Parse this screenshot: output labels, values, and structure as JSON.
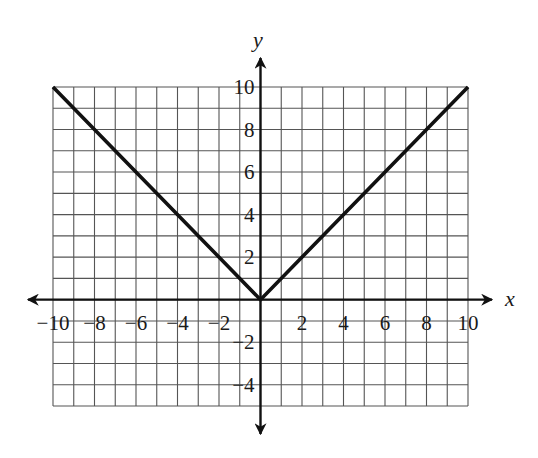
{
  "chart_data": {
    "type": "line",
    "title": "",
    "function": "y = |x|",
    "xlabel": "x",
    "ylabel": "y",
    "xlim": [
      -10,
      10
    ],
    "ylim": [
      -5,
      10
    ],
    "grid": true,
    "grid_step": 1,
    "x_ticks": [
      -10,
      -8,
      -6,
      -4,
      -2,
      2,
      4,
      6,
      8,
      10
    ],
    "x_tick_labels": [
      "−10",
      "−8",
      "−6",
      "−4",
      "−2",
      "2",
      "4",
      "6",
      "8",
      "10"
    ],
    "y_ticks": [
      10,
      8,
      6,
      4,
      2,
      -2,
      -4
    ],
    "y_tick_labels": [
      "10",
      "8",
      "6",
      "4",
      "2",
      "−2",
      "−4"
    ],
    "series": [
      {
        "name": "y = |x|",
        "x": [
          -10,
          0,
          10
        ],
        "y": [
          10,
          0,
          10
        ],
        "color": "#111111"
      }
    ],
    "legend": null
  },
  "colors": {
    "grid": "#555555",
    "axis": "#111111",
    "curve": "#111111"
  }
}
